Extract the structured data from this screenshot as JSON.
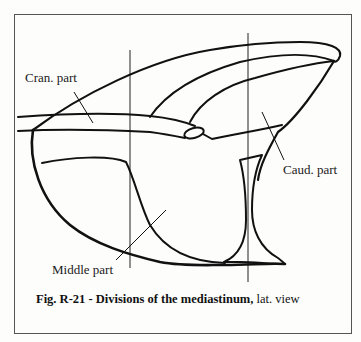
{
  "figure": {
    "labels": {
      "cranial": "Cran. part",
      "caudal": "Caud. part",
      "middle": "Middle part"
    },
    "caption": {
      "bold": "Fig. R-21 - Divisions of the mediastinum,",
      "normal": " lat. view"
    },
    "colors": {
      "ink": "#111111",
      "paper": "#fdfdfc",
      "frame": "#555555"
    }
  }
}
